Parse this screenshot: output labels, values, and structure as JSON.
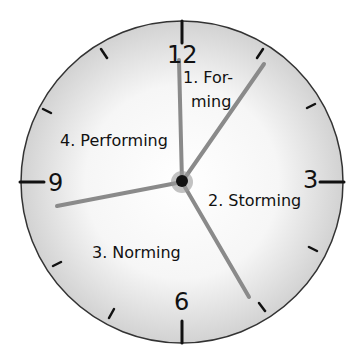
{
  "clock": {
    "numbers": {
      "twelve": "12",
      "three": "3",
      "six": "6",
      "nine": "9"
    },
    "colors": {
      "face_edge": "#d4d4d4",
      "face_center": "#ffffff",
      "rim": "#333333",
      "hand": "#8a8a8a",
      "hub": "#111111"
    }
  },
  "stages": [
    {
      "label_line1": "1. For-",
      "label_line2": "ming"
    },
    {
      "label": "2. Storming"
    },
    {
      "label": "3. Norming"
    },
    {
      "label": "4. Performing"
    }
  ]
}
